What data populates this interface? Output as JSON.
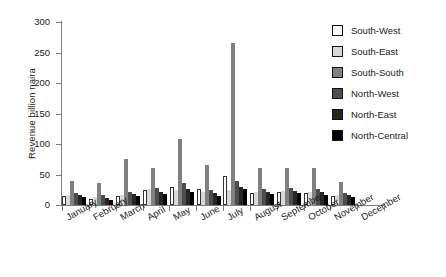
{
  "chart_data": {
    "type": "bar",
    "title": "",
    "xlabel": "",
    "ylabel": "Revenue billion naira",
    "ylim": [
      0,
      300
    ],
    "yticks": [
      0,
      50,
      100,
      150,
      200,
      250,
      300
    ],
    "grid": false,
    "legend_position": "right",
    "categories": [
      "January",
      "February",
      "March",
      "April",
      "May",
      "June",
      "July",
      "August",
      "September",
      "October",
      "November",
      "December"
    ],
    "series": [
      {
        "name": "South-West",
        "color": "#ffffff",
        "values": [
          14,
          10,
          15,
          24,
          30,
          27,
          48,
          20,
          21,
          20,
          15,
          0
        ]
      },
      {
        "name": "South-East",
        "color": "#d9d9d9",
        "values": [
          16,
          13,
          17,
          27,
          24,
          21,
          24,
          22,
          23,
          22,
          17,
          0
        ]
      },
      {
        "name": "South-South",
        "color": "#808080",
        "values": [
          40,
          36,
          75,
          60,
          108,
          65,
          265,
          60,
          60,
          60,
          38,
          0
        ]
      },
      {
        "name": "North-West",
        "color": "#4d4d4d",
        "values": [
          20,
          17,
          22,
          28,
          36,
          25,
          40,
          27,
          28,
          27,
          20,
          0
        ]
      },
      {
        "name": "North-East",
        "color": "#262626",
        "values": [
          16,
          12,
          18,
          22,
          26,
          20,
          30,
          22,
          23,
          21,
          16,
          0
        ]
      },
      {
        "name": "North-Central",
        "color": "#000000",
        "values": [
          13,
          9,
          14,
          18,
          22,
          15,
          26,
          18,
          19,
          17,
          13,
          0
        ]
      }
    ]
  },
  "legend": {
    "items": [
      {
        "label": "South-West",
        "color": "#ffffff"
      },
      {
        "label": "South-East",
        "color": "#d9d9d9"
      },
      {
        "label": "South-South",
        "color": "#808080"
      },
      {
        "label": "North-West",
        "color": "#4d4d4d"
      },
      {
        "label": "North-East",
        "color": "#262626"
      },
      {
        "label": "North-Central",
        "color": "#000000"
      }
    ]
  }
}
